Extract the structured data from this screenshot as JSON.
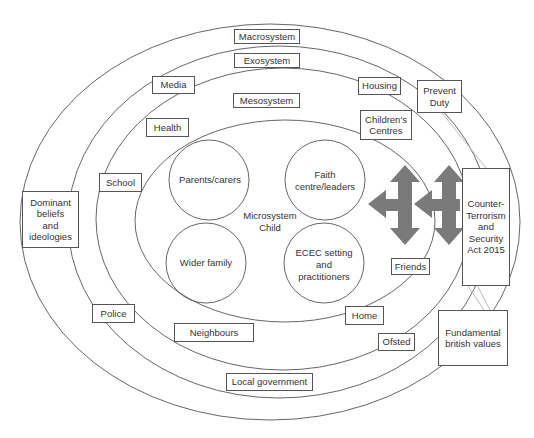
{
  "diagram": {
    "type": "nested-ecological-systems",
    "systems": {
      "macrosystem": "Macrosystem",
      "exosystem": "Exosystem",
      "mesosystem": "Mesosystem",
      "microsystem": "Microsystem",
      "centre": "Child"
    },
    "microsystem_circles": {
      "parents": "Parents/carers",
      "faith": "Faith\ncentre/leaders",
      "wider_family": "Wider family",
      "ecec": "ECEC setting\nand\npractitioners"
    },
    "mesosystem_labels": {
      "health": "Health",
      "school": "School",
      "childrens_centres": "Children's\nCentres",
      "friends": "Friends",
      "home": "Home",
      "neighbours": "Neighbours"
    },
    "exosystem_labels": {
      "media": "Media",
      "housing": "Housing",
      "police": "Police",
      "ofsted": "Ofsted",
      "local_government": "Local government"
    },
    "macrosystem_labels": {
      "dominant_beliefs": "Dominant\nbeliefs\nand\nideologies",
      "prevent_duty": "Prevent\nDuty",
      "counter_terrorism": "Counter-\nTerrorism\nand\nSecurity\nAct 2015",
      "fundamental_values": "Fundamental\nbritish values"
    },
    "colors": {
      "line": "#555555",
      "arrow": "#7a7a7a",
      "connector": "#bbbbbb"
    }
  }
}
